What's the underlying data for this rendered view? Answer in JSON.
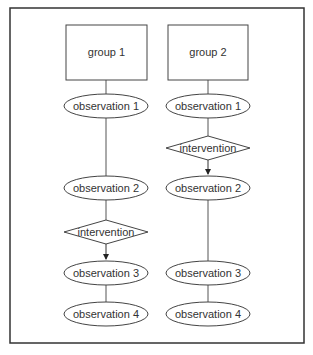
{
  "diagram": {
    "columns": [
      {
        "group": "group 1",
        "nodes": [
          {
            "type": "observation",
            "label": "observation 1"
          },
          {
            "type": "observation",
            "label": "observation 2"
          },
          {
            "type": "intervention",
            "label": "intervention"
          },
          {
            "type": "observation",
            "label": "observation 3"
          },
          {
            "type": "observation",
            "label": "observation 4"
          }
        ]
      },
      {
        "group": "group 2",
        "nodes": [
          {
            "type": "observation",
            "label": "observation 1"
          },
          {
            "type": "intervention",
            "label": "intervention"
          },
          {
            "type": "observation",
            "label": "observation 2"
          },
          {
            "type": "observation",
            "label": "observation 3"
          },
          {
            "type": "observation",
            "label": "observation 4"
          }
        ]
      }
    ]
  }
}
